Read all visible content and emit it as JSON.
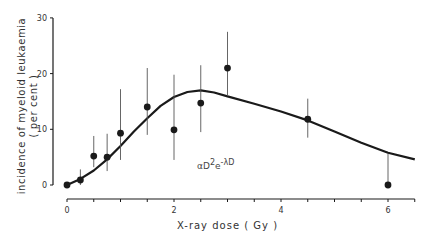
{
  "chart_data": {
    "type": "scatter",
    "title": "",
    "xlabel": "X-ray dose ( Gy )",
    "ylabel": "incidence of myeloid leukaemia",
    "ylabel_line2": "( per cent )",
    "xlim": [
      0,
      6.5
    ],
    "ylim": [
      0,
      30
    ],
    "x_ticks": [
      0,
      2,
      4,
      6
    ],
    "x_minor_step": 0.5,
    "y_ticks": [
      0,
      10,
      20,
      30
    ],
    "grid": false,
    "legend": null,
    "annotation": {
      "text": "αD²e⁻λD",
      "base": "αD",
      "sup1": "2",
      "mid": "e",
      "sup2": "-λD"
    },
    "series": [
      {
        "name": "observed incidence",
        "x": [
          0,
          0.25,
          0.5,
          0.75,
          1.0,
          1.5,
          2.0,
          2.5,
          3.0,
          4.5,
          6.0
        ],
        "y": [
          0,
          0.9,
          5.2,
          5.0,
          9.3,
          14.0,
          9.9,
          14.7,
          21.0,
          11.8,
          0
        ],
        "err_low": [
          0,
          0,
          3.2,
          2.5,
          4.5,
          9.0,
          4.5,
          9.5,
          16.0,
          8.5,
          0
        ],
        "err_high": [
          0,
          2.8,
          8.8,
          9.2,
          17.2,
          21.0,
          19.8,
          21.5,
          27.5,
          15.5,
          5.6
        ]
      },
      {
        "name": "fit αD²e^(-λD)",
        "type": "line",
        "x": [
          0,
          0.25,
          0.5,
          0.75,
          1.0,
          1.25,
          1.5,
          1.75,
          2.0,
          2.25,
          2.5,
          2.75,
          3.0,
          3.5,
          4.0,
          4.5,
          5.0,
          5.5,
          6.0,
          6.5
        ],
        "y": [
          0,
          1.1,
          2.6,
          4.6,
          7.0,
          9.6,
          12.0,
          14.2,
          15.8,
          16.7,
          17.0,
          16.6,
          15.9,
          14.6,
          13.2,
          11.6,
          9.6,
          7.6,
          5.8,
          4.6
        ]
      }
    ]
  },
  "axes": {
    "x_tick_labels": [
      "0",
      "2",
      "4",
      "6"
    ],
    "y_tick_labels": [
      "0",
      "10",
      "20",
      "30"
    ]
  }
}
